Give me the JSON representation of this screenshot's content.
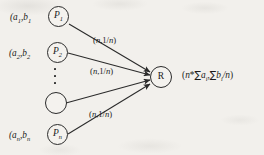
{
  "figure": {
    "background_color": "#f2f0ec",
    "ink_color": "#1a1a1a",
    "nodes": [
      {
        "id": "p1",
        "label_html": "P",
        "sub": "1",
        "coord": "(a",
        "coord_sub1": "1",
        "coord_mid": ",b",
        "coord_sub2": "1"
      },
      {
        "id": "p2",
        "label_html": "P",
        "sub": "2",
        "coord": "(a",
        "coord_sub1": "2",
        "coord_mid": ",b",
        "coord_sub2": "2"
      },
      {
        "id": "pblank",
        "label_html": "",
        "sub": "",
        "coord": "",
        "coord_sub1": "",
        "coord_mid": "",
        "coord_sub2": ""
      },
      {
        "id": "pn",
        "label_html": "P",
        "sub": "n",
        "coord": "(a",
        "coord_sub1": "n",
        "coord_mid": ",b",
        "coord_sub2": "n"
      }
    ],
    "node_labels": {
      "p1": "P",
      "p1_sub": "1",
      "p2": "P",
      "p2_sub": "2",
      "pn": "P",
      "pn_sub": "n",
      "result": "R"
    },
    "coord_labels": {
      "p1_open": "(a",
      "p1_sub_a": "1",
      "p1_comma_b": ",b",
      "p1_sub_b": "1",
      "p2_open": "(a",
      "p2_sub_a": "2",
      "p2_comma_b": ",b",
      "p2_sub_b": "2",
      "pn_open": "(a",
      "pn_sub_a": "n",
      "pn_comma_b": ",b",
      "pn_sub_b": "n"
    },
    "edge_labels": [
      {
        "id": "edge-label-1",
        "open": "(",
        "n": "n",
        "mid": ",1/",
        "n2": "n",
        "close": ")"
      },
      {
        "id": "edge-label-2",
        "open": "(",
        "n": "n",
        "mid": ",1/",
        "n2": "n",
        "close": ")"
      },
      {
        "id": "edge-label-3",
        "open": "(",
        "n": "n",
        "mid": ",1/",
        "n2": "n",
        "close": ")"
      }
    ],
    "edge_label_text": {
      "open_paren": "(",
      "n_var": "n",
      "separator": ",1/",
      "close_paren": ")"
    },
    "result_formula": {
      "open_paren": "(",
      "n_star": "n",
      "star": "*",
      "sigma1": "∑",
      "a_var": "a",
      "a_sub": "i",
      "comma": ",",
      "sigma2": "∑",
      "b_var": "b",
      "b_sub": "i",
      "div_n": "/n",
      "close_paren": ")"
    },
    "ellipsis": {
      "description": "vertical-ellipsis",
      "dot_count": 3
    }
  }
}
